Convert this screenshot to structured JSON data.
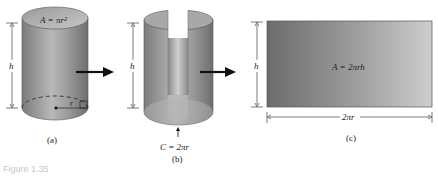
{
  "figure": {
    "caption": "Figure 1.35",
    "panels": [
      {
        "id": "a",
        "label": "(a)",
        "description": "Right circular cylinder with radius r and height h",
        "top_area_formula": "A = πr²",
        "height_label": "h",
        "radius_label": "r"
      },
      {
        "id": "b",
        "label": "(b)",
        "description": "Cylinder cut open along its side",
        "height_label": "h",
        "circumference_formula": "C = 2πr"
      },
      {
        "id": "c",
        "label": "(c)",
        "description": "Unrolled lateral surface as a rectangle",
        "area_formula": "A = 2πrh",
        "height_label": "h",
        "width_label": "2πr"
      }
    ],
    "colors": {
      "surface_dark": "#7a7a7a",
      "surface_light": "#c4c4c4",
      "rect_dark": "#6e6e6e",
      "rect_light": "#c9c9c9",
      "line": "#333333",
      "arrow": "#111111"
    }
  }
}
